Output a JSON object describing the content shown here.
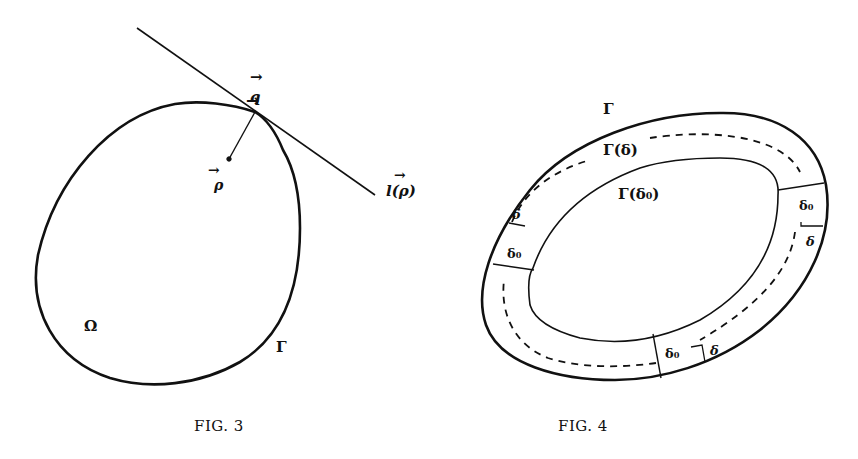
{
  "figure3": {
    "caption": "FIG. 3",
    "labels": {
      "q": "q",
      "rho": "ρ",
      "l_rho": "l(ρ)",
      "omega": "Ω",
      "gamma": "Γ"
    },
    "vector_arrow": "→"
  },
  "figure4": {
    "caption": "FIG. 4",
    "labels": {
      "gamma": "Γ",
      "gamma_delta": "Γ(δ)",
      "gamma_delta0": "Γ(δ₀)",
      "delta": "δ",
      "delta0": "δ₀"
    }
  },
  "colors": {
    "ink": "#111111",
    "paper": "#ffffff"
  }
}
